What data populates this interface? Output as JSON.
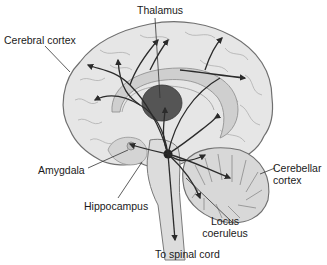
{
  "diagram": {
    "type": "anatomical-diagram",
    "labels": {
      "thalamus": "Thalamus",
      "cerebral_cortex": "Cerebral cortex",
      "amygdala": "Amygdala",
      "hippocampus": "Hippocampus",
      "cerebellar_cortex_line1": "Cerebellar",
      "cerebellar_cortex_line2": "cortex",
      "locus_coeruleus_line1": "Locus",
      "locus_coeruleus_line2": "coeruleus",
      "spinal_cord": "To spinal cord"
    },
    "colors": {
      "brain_fill": "#e6e6e6",
      "brain_outline": "#6f6f6f",
      "thalamus_fill": "#555555",
      "inner_structures": "#c9c9c9",
      "pathways": "#2b2b2b",
      "text": "#1a1a1a"
    }
  }
}
